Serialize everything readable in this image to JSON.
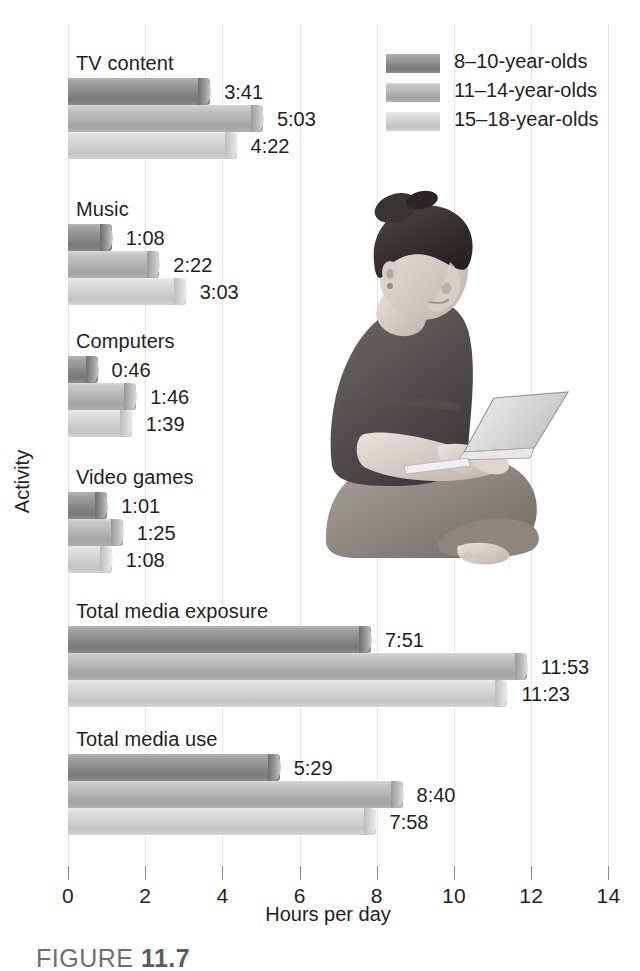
{
  "chart_data": {
    "type": "bar",
    "orientation": "horizontal",
    "title": "",
    "xlabel": "Hours per day",
    "ylabel": "Activity",
    "xlim": [
      0,
      14
    ],
    "xticks": [
      0,
      2,
      4,
      6,
      8,
      10,
      12,
      14
    ],
    "xtick_labels": [
      "0",
      "2",
      "4",
      "6",
      "8",
      "10",
      "12",
      "14"
    ],
    "grid": true,
    "grid_axis": "x",
    "legend_position": "top-right",
    "legend": [
      "8–10-year-olds",
      "11–14-year-olds",
      "15–18-year-olds"
    ],
    "categories": [
      "TV content",
      "Music",
      "Computers",
      "Video games",
      "Total media exposure",
      "Total media use"
    ],
    "series": [
      {
        "name": "8–10-year-olds",
        "color": "#8e8e8e",
        "labels": [
          "3:41",
          "1:08",
          "0:46",
          "1:01",
          "7:51",
          "5:29"
        ],
        "values": [
          3.683,
          1.133,
          0.767,
          1.017,
          7.85,
          5.483
        ]
      },
      {
        "name": "11–14-year-olds",
        "color": "#b5b5b5",
        "labels": [
          "5:03",
          "2:22",
          "1:46",
          "1:25",
          "11:53",
          "8:40"
        ],
        "values": [
          5.05,
          2.367,
          1.767,
          1.417,
          11.883,
          8.667
        ]
      },
      {
        "name": "15–18-year-olds",
        "color": "#d2d2d2",
        "labels": [
          "4:22",
          "3:03",
          "1:39",
          "1:08",
          "11:23",
          "7:58"
        ],
        "values": [
          4.367,
          3.05,
          1.65,
          1.133,
          11.383,
          7.967
        ]
      }
    ]
  },
  "photo": {
    "alt": "young woman sitting cross-legged using a laptop"
  },
  "caption": {
    "word": "FIGURE",
    "number": "11.7"
  }
}
